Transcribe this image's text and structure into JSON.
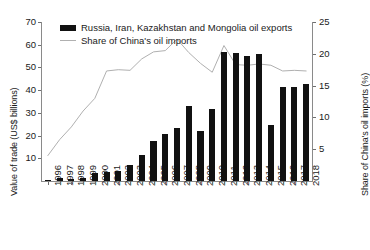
{
  "chart_data": {
    "type": "bar",
    "title": "",
    "xlabel": "",
    "ylabel": "Value of trade (US$ billions)",
    "y2label": "Share of China's oil imports (%)",
    "grid": false,
    "legend_position": "top-left",
    "categories": [
      "1996",
      "1997",
      "1998",
      "1999",
      "2000",
      "2001",
      "2002",
      "2003",
      "2004",
      "2005",
      "2006",
      "2007",
      "2008",
      "2009",
      "2010",
      "2011",
      "2012",
      "2013",
      "2014",
      "2015",
      "2016",
      "2017",
      "2018"
    ],
    "ylim": [
      0,
      70
    ],
    "yticks": [
      10,
      20,
      30,
      40,
      50,
      60,
      70
    ],
    "y2lim": [
      0,
      25
    ],
    "y2ticks": [
      5,
      10,
      15,
      20,
      25
    ],
    "series": [
      {
        "name": "Russia, Iran, Kazakhstan and Mongolia oil exports",
        "type": "bar",
        "axis": "left",
        "color": "#111111",
        "values": [
          0.6,
          1.2,
          1.0,
          1.3,
          3.5,
          4.0,
          4.3,
          7.0,
          11.5,
          17.5,
          20.5,
          23.5,
          33.0,
          22.0,
          31.5,
          57.0,
          56.5,
          55.0,
          55.8,
          24.5,
          41.5,
          41.5,
          42.5
        ]
      },
      {
        "name": "Share of China's oil imports",
        "type": "line",
        "axis": "right",
        "color": "#b0b0b0",
        "values": [
          4.0,
          6.5,
          8.5,
          11.0,
          13.0,
          17.3,
          17.5,
          17.4,
          19.2,
          20.3,
          20.5,
          22.3,
          20.2,
          18.5,
          17.1,
          21.3,
          18.3,
          18.2,
          18.4,
          18.2,
          17.3,
          17.4,
          17.3
        ]
      }
    ]
  },
  "legend": {
    "bar_label": "Russia, Iran, Kazakhstan and Mongolia oil exports",
    "line_label": "Share of China's oil imports"
  }
}
